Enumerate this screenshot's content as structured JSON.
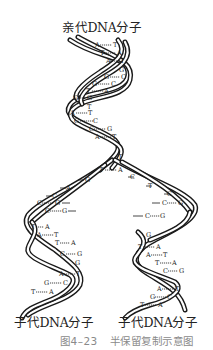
{
  "labels": {
    "parent": "亲代DNA分子",
    "daughter_left": "子代DNA分子",
    "daughter_right": "子代DNA分子"
  },
  "caption": {
    "figure_number": "图4–23",
    "title": "半保留复制示意图"
  },
  "parent_base_pairs": [
    {
      "left": "A",
      "right": "T"
    },
    {
      "left": "T",
      "right": "A"
    },
    {
      "left": "A",
      "right": "T"
    },
    {
      "left": "G",
      "right": "C"
    },
    {
      "left": "G",
      "right": "C"
    },
    {
      "left": "T",
      "right": "A"
    },
    {
      "left": "G",
      "right": "G"
    },
    {
      "left": "A",
      "right": "T"
    },
    {
      "left": "G",
      "right": "C"
    },
    {
      "left": "C",
      "right": "G"
    },
    {
      "left": "A",
      "right": "T"
    }
  ],
  "fork": {
    "pair": {
      "left": "T",
      "right": "A"
    },
    "left_free": [
      "G",
      "A",
      "C"
    ],
    "right_free": [
      "C",
      "T",
      "C"
    ]
  },
  "left_daughter_pairs": [
    {
      "left": "C",
      "right": "G"
    },
    {
      "left": "C",
      "right": "G"
    },
    {
      "left": "T",
      "right": "A"
    },
    {
      "left": "A",
      "right": "T"
    },
    {
      "left": "T",
      "right": "A"
    },
    {
      "left": "C",
      "right": "G"
    },
    {
      "left": "A",
      "right": "T"
    },
    {
      "left": "G",
      "right": "C"
    },
    {
      "left": "T",
      "right": "A"
    }
  ],
  "right_daughter_pairs": [
    {
      "left": "C",
      "right": "G"
    },
    {
      "left": "C",
      "right": "G"
    },
    {
      "left": "T",
      "right": "A"
    },
    {
      "left": "A",
      "right": "T"
    },
    {
      "left": "T",
      "right": "A"
    },
    {
      "left": "C",
      "right": "G"
    },
    {
      "left": "A",
      "right": "T"
    },
    {
      "left": "G",
      "right": "C"
    },
    {
      "left": "T",
      "right": "A"
    }
  ],
  "colors": {
    "strand": "#1a1a1a",
    "text": "#222222",
    "caption": "#8a8a8a",
    "background": "#ffffff"
  }
}
